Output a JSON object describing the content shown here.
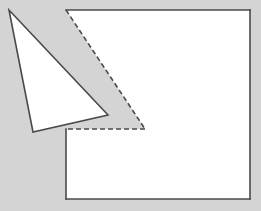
{
  "canvas": {
    "width": 261,
    "height": 211,
    "background_color": "#d4d4d4",
    "title": "geometry-figure"
  },
  "style": {
    "fill_color": "#ffffff",
    "stroke_color": "#4a4a4a",
    "stroke_width": 1.6,
    "dash_pattern": "5,3"
  },
  "shapes": {
    "polygon": {
      "name": "notched-rectangle",
      "fill": "#ffffff",
      "points": "66,10 250,10 250,199 66,199 66,129 145,129",
      "solid_edges": [
        {
          "name": "top-edge",
          "from": "66,10",
          "to": "250,10",
          "d": "M 66 10 L 250 10"
        },
        {
          "name": "right-edge",
          "from": "250,10",
          "to": "250,199",
          "d": "M 250 10 L 250 199"
        },
        {
          "name": "bottom-edge",
          "from": "250,199",
          "to": "66,199",
          "d": "M 250 199 L 66 199"
        },
        {
          "name": "left-edge",
          "from": "66,199",
          "to": "66,129",
          "d": "M 66 199 L 66 129"
        }
      ],
      "dashed_edges": [
        {
          "name": "notch-horizontal-edge",
          "from": "145,129",
          "to": "66,129",
          "d": "M 145 129 L 66 129"
        },
        {
          "name": "notch-diagonal-edge",
          "from": "66,10",
          "to": "145,129",
          "d": "M 66 10 L 145 129"
        }
      ]
    },
    "triangle": {
      "name": "overlapping-triangle",
      "fill": "#ffffff",
      "points": "9,10 108,115 33,132",
      "vertices": [
        {
          "name": "apex-vertex",
          "x": 9,
          "y": 10
        },
        {
          "name": "right-vertex",
          "x": 108,
          "y": 115
        },
        {
          "name": "bottom-vertex",
          "x": 33,
          "y": 132
        }
      ]
    }
  }
}
